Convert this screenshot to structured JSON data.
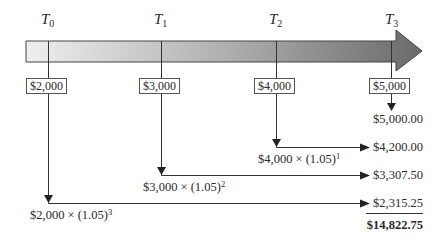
{
  "timeline": {
    "points": [
      {
        "label": "T",
        "sub": "0",
        "deposit": "$2,000"
      },
      {
        "label": "T",
        "sub": "1",
        "deposit": "$3,000"
      },
      {
        "label": "T",
        "sub": "2",
        "deposit": "$4,000"
      },
      {
        "label": "T",
        "sub": "3",
        "deposit": "$5,000"
      }
    ]
  },
  "formulas": [
    {
      "base": "$4,000 × (1.05)",
      "exp": "1"
    },
    {
      "base": "$3,000 × (1.05)",
      "exp": "2"
    },
    {
      "base": "$2,000 × (1.05)",
      "exp": "3"
    }
  ],
  "future_values": [
    "$5,000.00",
    "$4,200.00",
    "$3,307.50",
    "$2,315.25"
  ],
  "total": "$14,822.75",
  "colors": {
    "arrow_start": "#ececec",
    "arrow_end": "#6e6e6e",
    "line": "#333333"
  }
}
